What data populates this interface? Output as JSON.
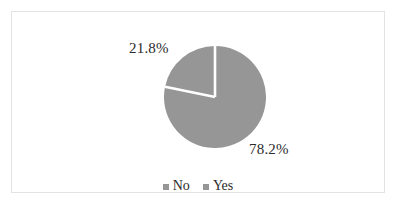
{
  "chart_data": {
    "type": "pie",
    "title": "",
    "categories": [
      "No",
      "Yes"
    ],
    "values": [
      78.2,
      21.8
    ],
    "value_unit": "%",
    "data_labels": [
      "78.2%",
      "21.8%"
    ],
    "slice_colors": [
      "#969696",
      "#969696"
    ],
    "separator_color": "#ffffff",
    "start_angle_deg": 0,
    "direction": "clockwise",
    "legend": {
      "position": "bottom",
      "entries": [
        {
          "label": "No",
          "color": "#969696",
          "marker": "square-marker"
        },
        {
          "label": "Yes",
          "color": "#969696",
          "marker": "square-marker"
        }
      ]
    },
    "grid": false,
    "xlabel": "",
    "ylabel": ""
  },
  "labels": {
    "yes_pct": "21.8%",
    "no_pct": "78.2%"
  },
  "legend": {
    "no_label": "No",
    "yes_label": "Yes"
  },
  "colors": {
    "slice_fill": "#969696",
    "frame_border": "#e3e3e3",
    "text": "#2b2b2b",
    "background": "#ffffff"
  }
}
